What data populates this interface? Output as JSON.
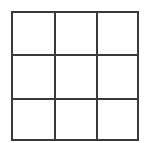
{
  "board": {
    "rows": 3,
    "cols": 3,
    "line_color": "#3a3a3a",
    "background": "#ffffff",
    "cells": [
      [
        "",
        "",
        ""
      ],
      [
        "",
        "",
        ""
      ],
      [
        "",
        "",
        ""
      ]
    ]
  }
}
